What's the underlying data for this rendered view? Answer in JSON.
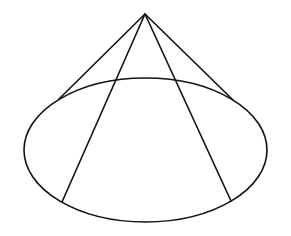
{
  "diagram": {
    "type": "geometry",
    "background": "#ffffff",
    "stroke_color": "#111111",
    "stroke_width": 1.6,
    "apex": {
      "x": 145,
      "y": 14
    },
    "base_ellipse": {
      "cx": 145.5,
      "cy": 150,
      "rx": 121.5,
      "ry": 72
    },
    "outline_generators": [
      {
        "from": {
          "x": 145,
          "y": 14
        },
        "to": {
          "x": 59,
          "y": 99
        }
      },
      {
        "from": {
          "x": 145,
          "y": 14
        },
        "to": {
          "x": 233,
          "y": 100
        }
      }
    ],
    "inner_generators": [
      {
        "from": {
          "x": 145,
          "y": 14
        },
        "to": {
          "x": 62,
          "y": 202
        }
      },
      {
        "from": {
          "x": 145,
          "y": 14
        },
        "to": {
          "x": 231,
          "y": 201
        }
      }
    ]
  }
}
